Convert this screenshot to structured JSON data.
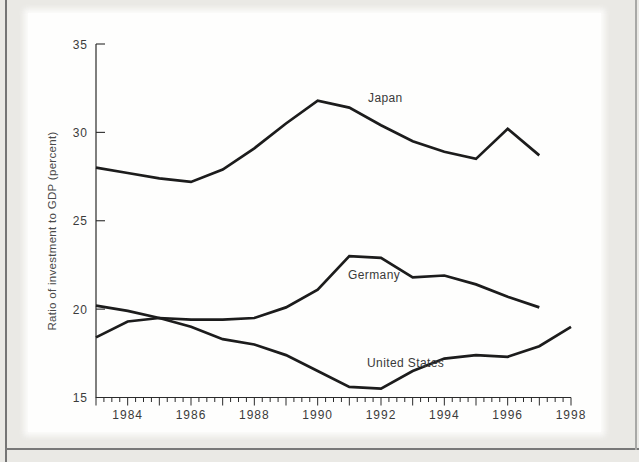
{
  "page": {
    "background_color": "#eae9e5",
    "panel_color": "#fefefd",
    "frame_color": "#757575",
    "axis_color": "#2b2b2b",
    "text_color": "#3b3b3b"
  },
  "chart_data": {
    "type": "line",
    "title": "",
    "xlabel": "",
    "ylabel": "Ratio of investment to GDP (percent)",
    "x_range": [
      1983,
      1998
    ],
    "y_range": [
      15,
      35
    ],
    "y_ticks": [
      15,
      20,
      25,
      30,
      35
    ],
    "x_labeled_ticks": [
      1984,
      1986,
      1988,
      1990,
      1992,
      1994,
      1996,
      1998
    ],
    "x_minor_tick_step": 0.25,
    "grid": "off",
    "legend_position": "inline-labels",
    "line_color": "#1c1c1c",
    "series": [
      {
        "name": "Japan",
        "x": [
          1983,
          1984,
          1985,
          1986,
          1987,
          1988,
          1989,
          1990,
          1991,
          1992,
          1993,
          1994,
          1995,
          1996,
          1997
        ],
        "values": [
          28.0,
          27.7,
          27.4,
          27.2,
          27.9,
          29.1,
          30.5,
          31.8,
          31.4,
          30.4,
          29.5,
          28.9,
          28.5,
          30.2,
          28.7
        ]
      },
      {
        "name": "Germany",
        "x": [
          1983,
          1984,
          1985,
          1986,
          1987,
          1988,
          1989,
          1990,
          1991,
          1992,
          1993,
          1994,
          1995,
          1996,
          1997
        ],
        "values": [
          18.4,
          19.3,
          19.5,
          19.4,
          19.4,
          19.5,
          20.1,
          21.1,
          23.0,
          22.9,
          21.8,
          21.9,
          21.4,
          20.7,
          20.1
        ]
      },
      {
        "name": "United States",
        "x": [
          1983,
          1984,
          1985,
          1986,
          1987,
          1988,
          1989,
          1990,
          1991,
          1992,
          1993,
          1994,
          1995,
          1996,
          1997,
          1998
        ],
        "values": [
          20.2,
          19.9,
          19.5,
          19.0,
          18.3,
          18.0,
          17.4,
          16.5,
          15.6,
          15.5,
          16.5,
          17.2,
          17.4,
          17.3,
          17.9,
          19.0
        ]
      }
    ]
  }
}
